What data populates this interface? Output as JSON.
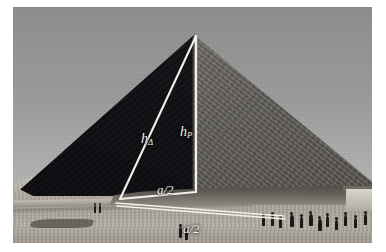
{
  "figure": {
    "caption": "",
    "media_type": "black-and-white photograph"
  },
  "labels": {
    "slant_height": {
      "symbol": "h",
      "subscript": "Δ",
      "full": "hΔ",
      "meaning": "slant height (apothem) of triangular face"
    },
    "pyramid_height": {
      "symbol": "h",
      "subscript": "P",
      "full": "hP",
      "meaning": "vertical height of the pyramid"
    },
    "half_base_upper": {
      "text": "a/2",
      "meaning": "half of the base edge length, horizontal leg"
    },
    "half_base_lower": {
      "text": "a/2",
      "meaning": "half of the base edge length, projected on the ground"
    }
  },
  "geometry": {
    "overlay_color": "#f2f0ea",
    "apex": {
      "x": 183,
      "y": 29
    },
    "left_vertex": {
      "x": 107,
      "y": 192
    },
    "right_angle_vertex": {
      "x": 183,
      "y": 185
    },
    "ground_left": {
      "x": 103,
      "y": 197
    },
    "ground_right": {
      "x": 271,
      "y": 209
    },
    "segments": [
      {
        "name": "slant-height-line",
        "from": "apex",
        "to": "left_vertex",
        "label": "hΔ"
      },
      {
        "name": "pyramid-height-line",
        "from": "apex",
        "to": "right_angle_vertex",
        "label": "hP"
      },
      {
        "name": "half-base-line",
        "from": "left_vertex",
        "to": "right_angle_vertex",
        "label": "a/2"
      },
      {
        "name": "ground-base-line",
        "from": "ground_left",
        "to": "ground_right",
        "label": "a/2"
      }
    ]
  },
  "colors": {
    "sky": "#9b9b9b",
    "lit_face": "#6e6b65",
    "shadow_face": "#121115",
    "ground": "#b0aba1",
    "overlay": "#f2f0ea",
    "plate_border": "#ffffff"
  },
  "people": [
    {
      "x": 81,
      "y": 196,
      "h": 8
    },
    {
      "x": 86,
      "y": 196,
      "h": 8
    },
    {
      "x": 166,
      "y": 218,
      "h": 11
    },
    {
      "x": 172,
      "y": 221,
      "h": 10
    },
    {
      "x": 249,
      "y": 207,
      "h": 10
    },
    {
      "x": 258,
      "y": 206,
      "h": 11
    },
    {
      "x": 266,
      "y": 209,
      "h": 10
    },
    {
      "x": 277,
      "y": 206,
      "h": 12
    },
    {
      "x": 287,
      "y": 208,
      "h": 11
    },
    {
      "x": 296,
      "y": 205,
      "h": 12
    },
    {
      "x": 305,
      "y": 210,
      "h": 12
    },
    {
      "x": 313,
      "y": 207,
      "h": 11
    },
    {
      "x": 322,
      "y": 211,
      "h": 10
    },
    {
      "x": 331,
      "y": 206,
      "h": 11
    },
    {
      "x": 341,
      "y": 209,
      "h": 10
    },
    {
      "x": 351,
      "y": 205,
      "h": 11
    }
  ]
}
